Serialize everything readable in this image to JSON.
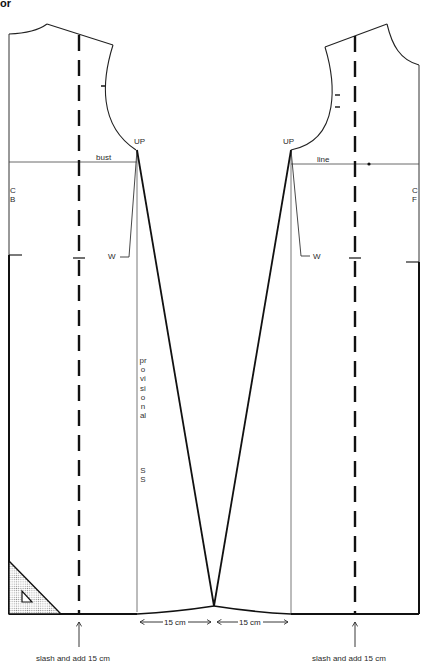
{
  "heading": "or",
  "diagram": {
    "title_fragment": "or",
    "left_panel": {
      "name": "back",
      "centre_label_line1": "C",
      "centre_label_line2": "B",
      "bust_label": "bust",
      "underarm_point": "UP",
      "waist_label": "W",
      "slash_note": "slash and add 15 cm"
    },
    "right_panel": {
      "name": "front",
      "centre_label_line1": "C",
      "centre_label_line2": "F",
      "bust_label": "line",
      "underarm_point": "UP",
      "waist_label": "W",
      "slash_note": "slash and add 15 cm"
    },
    "side_seam_label": "provisional SS",
    "side_seam_letters": "provisional",
    "side_seam_suffix": "SS",
    "hem_extension_left": "15 cm",
    "hem_extension_right": "15 cm",
    "colors": {
      "ink": "#1a1a1a",
      "thin_line": "#444444",
      "background": "#ffffff",
      "stipple": "#9a9a9a"
    }
  }
}
